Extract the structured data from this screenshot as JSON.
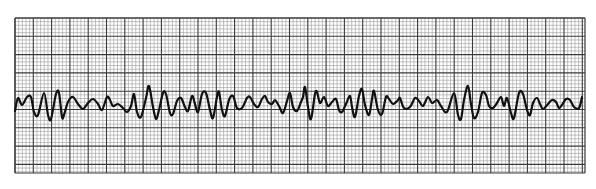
{
  "chart_data": {
    "type": "line",
    "title": "",
    "xlabel": "",
    "ylabel": "",
    "grid": {
      "on": true,
      "left": 15,
      "top": 18,
      "right": 585,
      "bottom": 173,
      "small_square_px": 3.66,
      "large_square_px": 18.3,
      "minor_color": "#9a9a9a",
      "major_color": "#3a3a3a"
    },
    "trace_color": "#111111",
    "baseline_y": 103,
    "x": [
      15,
      18,
      22,
      27,
      31,
      34,
      38,
      44,
      48,
      51,
      56,
      59,
      62,
      64,
      68,
      73,
      78,
      83,
      88,
      93,
      98,
      102,
      107,
      110,
      113,
      118,
      123,
      127,
      131,
      134,
      137,
      141,
      146,
      149,
      153,
      156,
      159,
      163,
      166,
      170,
      173,
      177,
      181,
      185,
      188,
      192,
      195,
      198,
      202,
      206,
      210,
      213,
      217,
      219,
      222,
      225,
      229,
      233,
      237,
      242,
      247,
      250,
      254,
      258,
      262,
      265,
      268,
      272,
      275,
      279,
      283,
      287,
      290,
      293,
      297,
      301,
      303,
      305,
      308,
      311,
      315,
      317,
      320,
      324,
      328,
      332,
      336,
      339,
      342,
      346,
      350,
      352,
      355,
      359,
      362,
      365,
      369,
      372,
      374,
      378,
      382,
      386,
      389,
      393,
      398,
      400,
      404,
      410,
      415,
      419,
      423,
      428,
      432,
      437,
      441,
      447,
      454,
      458,
      461,
      464,
      468,
      471,
      474,
      478,
      482,
      486,
      489,
      493,
      497,
      501,
      504,
      507,
      511,
      514,
      519,
      523,
      527,
      530,
      533,
      537,
      540,
      543,
      548,
      552,
      556,
      559,
      562,
      566,
      570,
      574,
      579,
      582
    ],
    "y": [
      111,
      98,
      105,
      97,
      97,
      112,
      115,
      93,
      115,
      119,
      94,
      93,
      117,
      115,
      102,
      97,
      104,
      109,
      103,
      99,
      104,
      110,
      97,
      100,
      106,
      104,
      108,
      112,
      106,
      94,
      112,
      117,
      98,
      86,
      107,
      119,
      110,
      93,
      94,
      113,
      114,
      101,
      98,
      107,
      111,
      96,
      104,
      112,
      94,
      93,
      110,
      118,
      97,
      92,
      110,
      116,
      100,
      96,
      108,
      108,
      98,
      97,
      104,
      107,
      99,
      96,
      102,
      104,
      100,
      106,
      113,
      101,
      93,
      107,
      111,
      102,
      97,
      87,
      107,
      119,
      94,
      92,
      103,
      97,
      106,
      102,
      99,
      110,
      112,
      104,
      96,
      107,
      117,
      96,
      89,
      105,
      115,
      99,
      91,
      110,
      114,
      97,
      99,
      104,
      100,
      98,
      108,
      107,
      98,
      101,
      106,
      97,
      103,
      100,
      106,
      112,
      93,
      115,
      119,
      100,
      86,
      104,
      118,
      112,
      93,
      95,
      106,
      108,
      103,
      97,
      106,
      98,
      113,
      118,
      93,
      94,
      110,
      115,
      103,
      98,
      104,
      109,
      104,
      100,
      102,
      108,
      105,
      99,
      100,
      107,
      108,
      97
    ]
  }
}
